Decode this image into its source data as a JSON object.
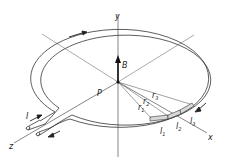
{
  "diagram": {
    "labels": {
      "y_axis": "y",
      "x_axis": "x",
      "z_axis": "z",
      "field": "B",
      "center": "P",
      "current": "I",
      "radii": [
        {
          "base": "r",
          "sub": "1"
        },
        {
          "base": "r",
          "sub": "2"
        },
        {
          "base": "r",
          "sub": "3"
        }
      ],
      "segments": [
        {
          "base": "l",
          "sub": "1"
        },
        {
          "base": "l",
          "sub": "2"
        },
        {
          "base": "l",
          "sub": "3"
        }
      ]
    },
    "colors": {
      "line": "#333333",
      "segment_fill": "#d8d8d8",
      "background": "#ffffff"
    }
  }
}
